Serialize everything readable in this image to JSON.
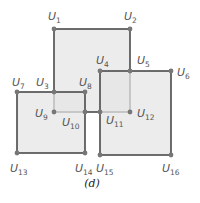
{
  "colors": {
    "fill": "#e6e6e6",
    "edge": "#4a4a4a",
    "vertex": "#777777",
    "label": "#555555"
  },
  "caption": "(d)",
  "vertices": [
    {
      "id": "U1",
      "letter": "U",
      "sub": "1",
      "x": 54,
      "y": 29,
      "lx": 48,
      "ly": 20
    },
    {
      "id": "U2",
      "letter": "U",
      "sub": "2",
      "x": 130,
      "y": 29,
      "lx": 124,
      "ly": 20
    },
    {
      "id": "U3",
      "letter": "U",
      "sub": "3",
      "x": 54,
      "y": 92,
      "lx": 36,
      "ly": 86
    },
    {
      "id": "U4",
      "letter": "U",
      "sub": "4",
      "x": 100,
      "y": 71,
      "lx": 96,
      "ly": 64
    },
    {
      "id": "U5",
      "letter": "U",
      "sub": "5",
      "x": 130,
      "y": 71,
      "lx": 137,
      "ly": 64
    },
    {
      "id": "U6",
      "letter": "U",
      "sub": "6",
      "x": 171,
      "y": 71,
      "lx": 177,
      "ly": 76
    },
    {
      "id": "U7",
      "letter": "U",
      "sub": "7",
      "x": 17,
      "y": 92,
      "lx": 12,
      "ly": 86
    },
    {
      "id": "U8",
      "letter": "U",
      "sub": "8",
      "x": 85,
      "y": 92,
      "lx": 79,
      "ly": 86
    },
    {
      "id": "U9",
      "letter": "U",
      "sub": "9",
      "x": 54,
      "y": 112,
      "lx": 35,
      "ly": 117
    },
    {
      "id": "U10",
      "letter": "U",
      "sub": "10",
      "x": 85,
      "y": 112,
      "lx": 62,
      "ly": 126
    },
    {
      "id": "U11",
      "letter": "U",
      "sub": "11",
      "x": 100,
      "y": 112,
      "lx": 106,
      "ly": 124
    },
    {
      "id": "U12",
      "letter": "U",
      "sub": "12",
      "x": 130,
      "y": 112,
      "lx": 137,
      "ly": 117
    },
    {
      "id": "U13",
      "letter": "U",
      "sub": "13",
      "x": 17,
      "y": 153,
      "lx": 10,
      "ly": 172
    },
    {
      "id": "U14",
      "letter": "U",
      "sub": "14",
      "x": 85,
      "y": 153,
      "lx": 75,
      "ly": 172
    },
    {
      "id": "U15",
      "letter": "U",
      "sub": "15",
      "x": 100,
      "y": 155,
      "lx": 96,
      "ly": 172
    },
    {
      "id": "U16",
      "letter": "U",
      "sub": "16",
      "x": 171,
      "y": 155,
      "lx": 162,
      "ly": 172
    }
  ],
  "rectangles": [
    {
      "name": "top-square",
      "x": 54,
      "y": 29,
      "w": 76,
      "h": 83
    },
    {
      "name": "left-square",
      "x": 17,
      "y": 92,
      "w": 68,
      "h": 61
    },
    {
      "name": "right-square",
      "x": 100,
      "y": 71,
      "w": 71,
      "h": 84
    }
  ]
}
